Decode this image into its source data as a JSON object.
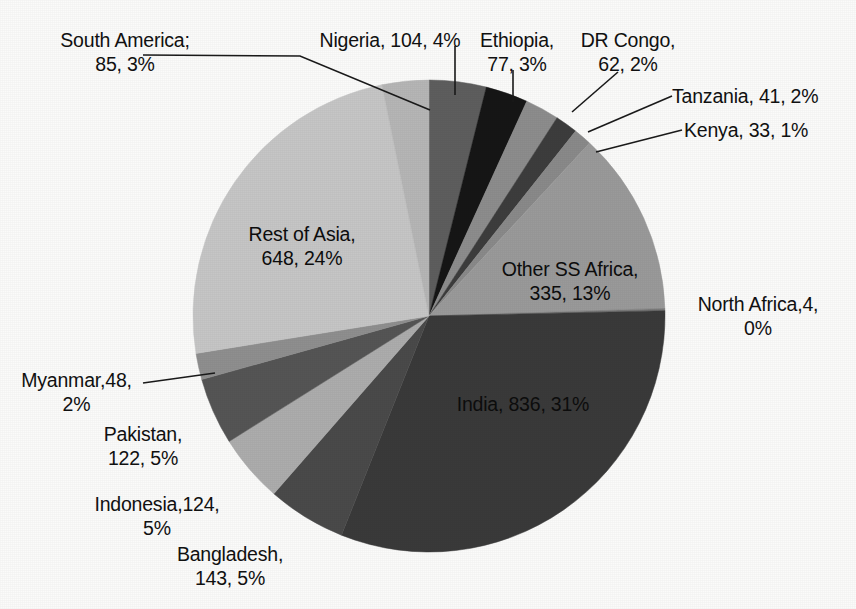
{
  "chart_data": {
    "type": "pie",
    "title": "",
    "subtitle": "",
    "xlabel": "",
    "ylabel": "",
    "legend_position": "none",
    "grid": false,
    "total": 2662,
    "units": "millions",
    "start_angle_deg": 0,
    "direction": "clockwise",
    "categories": [
      "Nigeria",
      "Ethiopia",
      "DR Congo",
      "Tanzania",
      "Kenya",
      "Other SS Africa",
      "North Africa",
      "India",
      "Bangladesh",
      "Indonesia",
      "Pakistan",
      "Myanmar",
      "Rest of Asia",
      "South America"
    ],
    "values": [
      104,
      77,
      62,
      41,
      33,
      335,
      4,
      836,
      143,
      124,
      122,
      48,
      648,
      85
    ],
    "percents": [
      4,
      3,
      2,
      2,
      1,
      13,
      0,
      31,
      5,
      5,
      5,
      2,
      24,
      3
    ],
    "colors": [
      "#5e5e5e",
      "#161616",
      "#8d8d8d",
      "#3d3d3d",
      "#8a8a8a",
      "#9a9a9a",
      "#7a7a7a",
      "#3a3a3a",
      "#4a4a4a",
      "#adadad",
      "#555555",
      "#8f8f8f",
      "#c6c6c6",
      "#b6b6b6"
    ],
    "slices": [
      {
        "name": "Nigeria",
        "value": 104,
        "percent": 4,
        "label": "Nigeria, 104, 4%"
      },
      {
        "name": "Ethiopia",
        "value": 77,
        "percent": 3,
        "label": "Ethiopia,\n77, 3%"
      },
      {
        "name": "DR Congo",
        "value": 62,
        "percent": 2,
        "label": "DR Congo,\n62, 2%"
      },
      {
        "name": "Tanzania",
        "value": 41,
        "percent": 2,
        "label": "Tanzania, 41, 2%"
      },
      {
        "name": "Kenya",
        "value": 33,
        "percent": 1,
        "label": "Kenya, 33, 1%"
      },
      {
        "name": "Other SS Africa",
        "value": 335,
        "percent": 13,
        "label": "Other SS Africa,\n335, 13%"
      },
      {
        "name": "North Africa",
        "value": 4,
        "percent": 0,
        "label": "North Africa,4,\n0%"
      },
      {
        "name": "India",
        "value": 836,
        "percent": 31,
        "label": "India, 836, 31%"
      },
      {
        "name": "Bangladesh",
        "value": 143,
        "percent": 5,
        "label": "Bangladesh,\n143, 5%"
      },
      {
        "name": "Indonesia",
        "value": 124,
        "percent": 5,
        "label": "Indonesia,124,\n5%"
      },
      {
        "name": "Pakistan",
        "value": 122,
        "percent": 5,
        "label": "Pakistan,\n122, 5%"
      },
      {
        "name": "Myanmar",
        "value": 48,
        "percent": 2,
        "label": "Myanmar,48,\n2%"
      },
      {
        "name": "Rest of Asia",
        "value": 648,
        "percent": 24,
        "label": "Rest of Asia,\n648, 24%"
      },
      {
        "name": "South America",
        "value": 85,
        "percent": 3,
        "label": "South America;\n85, 3%"
      }
    ]
  },
  "labels": {
    "south_america": "South America;\n85, 3%",
    "nigeria": "Nigeria, 104, 4%",
    "ethiopia": "Ethiopia,\n77, 3%",
    "dr_congo": "DR Congo,\n62, 2%",
    "tanzania": "Tanzania, 41, 2%",
    "kenya": "Kenya, 33, 1%",
    "other_ss_africa": "Other SS Africa,\n335, 13%",
    "north_africa": "North Africa,4,\n0%",
    "india": "India, 836, 31%",
    "rest_of_asia": "Rest of Asia,\n648, 24%",
    "myanmar": "Myanmar,48,\n2%",
    "pakistan": "Pakistan,\n122, 5%",
    "indonesia": "Indonesia,124,\n5%",
    "bangladesh": "Bangladesh,\n143, 5%"
  },
  "style": {
    "background": "#fbfbfa",
    "leader_line_color": "#1a1a1a",
    "text_color": "#111111"
  }
}
